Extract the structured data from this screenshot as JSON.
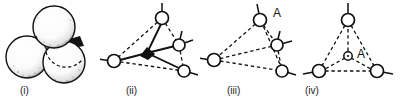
{
  "figure": {
    "background_color": "#ffffff",
    "ink_color": "#111111",
    "width": 404,
    "height": 102,
    "panel_count": 4
  },
  "panels": [
    {
      "id": "panel-i",
      "caption": "(i)",
      "caption_x": 20,
      "caption_y": 86,
      "type": "sphere-packing",
      "description": "cluster of four shaded close-packed spheres with hidden sphere shown as dashed outline",
      "sphere_count": 4,
      "spheres": [
        {
          "name": "sphere-top",
          "cx": 54,
          "cy": 27,
          "r": 21,
          "style": "solid-shaded"
        },
        {
          "name": "sphere-left",
          "cx": 27,
          "cy": 57,
          "r": 21,
          "style": "solid-shaded"
        },
        {
          "name": "sphere-right",
          "cx": 64,
          "cy": 62,
          "r": 21,
          "style": "solid-shaded"
        },
        {
          "name": "sphere-hidden",
          "cx": 52,
          "cy": 46,
          "r": 21,
          "style": "dashed-outline"
        }
      ]
    },
    {
      "id": "panel-ii",
      "caption": "(ii)",
      "caption_x": 126,
      "caption_y": 86,
      "type": "coordination-tetrahedron",
      "description": "distorted tetrahedron with filled black central atom bonded by solid lines",
      "center_atom": {
        "name": "center-atom-filled",
        "cx": 47,
        "cy": 53,
        "r": 3.6,
        "style": "filled"
      },
      "atoms": [
        {
          "name": "atom-top",
          "cx": 62,
          "cy": 18,
          "r": 6.5,
          "stub_angle": -90
        },
        {
          "name": "atom-left",
          "cx": 14,
          "cy": 61,
          "r": 6.5,
          "stub_angle": 185
        },
        {
          "name": "atom-right",
          "cx": 79,
          "cy": 45,
          "r": 6.0,
          "stub_angle": -22
        },
        {
          "name": "atom-bottom-right",
          "cx": 84,
          "cy": 71,
          "r": 6.0,
          "stub_angle": 14
        }
      ],
      "solid_bonds": [
        [
          0,
          "top"
        ],
        [
          0,
          "right"
        ],
        [
          0,
          "bottom-right"
        ]
      ],
      "dashed_bonds": [
        [
          "center",
          "left"
        ],
        [
          "top",
          "left"
        ],
        [
          "top",
          "right"
        ],
        [
          "left",
          "bottom-right"
        ],
        [
          "right",
          "bottom-right"
        ]
      ]
    },
    {
      "id": "panel-iii",
      "caption": "(iii)",
      "caption_x": 227,
      "caption_y": 86,
      "type": "coordination-tetrahedron",
      "description": "distorted tetrahedron, all bonds dashed, apex atom labelled A",
      "atom_label": "A",
      "atom_label_x": 78,
      "atom_label_y": 19,
      "atoms": [
        {
          "name": "atom-top-labelled-a",
          "cx": 60,
          "cy": 20,
          "r": 6.5,
          "stub_angle": -100
        },
        {
          "name": "atom-left",
          "cx": 14,
          "cy": 60,
          "r": 6.5,
          "stub_angle": 185
        },
        {
          "name": "atom-right",
          "cx": 77,
          "cy": 45,
          "r": 6.0,
          "stub_angle": -18
        },
        {
          "name": "atom-bottom-right",
          "cx": 82,
          "cy": 71,
          "r": 6.0,
          "stub_angle": 16
        }
      ],
      "dashed_bonds": [
        [
          "top",
          "left"
        ],
        [
          "top",
          "right"
        ],
        [
          "top",
          "bottom-right"
        ],
        [
          "left",
          "right"
        ],
        [
          "left",
          "bottom-right"
        ],
        [
          "right",
          "bottom-right"
        ]
      ]
    },
    {
      "id": "panel-iv",
      "caption": "(iv)",
      "caption_x": 305,
      "caption_y": 86,
      "type": "coordination-triangle",
      "description": "symmetric triangle of three atoms with small dotted-circle interstitial site labelled A at centre",
      "atom_label": "A",
      "atom_label_x": 61,
      "atom_label_y": 54,
      "center_atom": {
        "name": "interstitial-site-a",
        "cx": 48,
        "cy": 56,
        "r": 4.2,
        "style": "circle-with-dot"
      },
      "atoms": [
        {
          "name": "atom-top",
          "cx": 48,
          "cy": 20,
          "r": 6.5,
          "stub_angle": -90
        },
        {
          "name": "atom-bottom-left",
          "cx": 19,
          "cy": 71,
          "r": 6.5,
          "stub_angle": 190
        },
        {
          "name": "atom-bottom-right",
          "cx": 77,
          "cy": 71,
          "r": 6.5,
          "stub_angle": 10
        }
      ],
      "dashed_bonds": [
        [
          "top",
          "bottom-left"
        ],
        [
          "top",
          "bottom-right"
        ],
        [
          "bottom-left",
          "bottom-right"
        ],
        [
          "center",
          "top"
        ],
        [
          "center",
          "bottom-left"
        ],
        [
          "center",
          "bottom-right"
        ]
      ]
    }
  ]
}
